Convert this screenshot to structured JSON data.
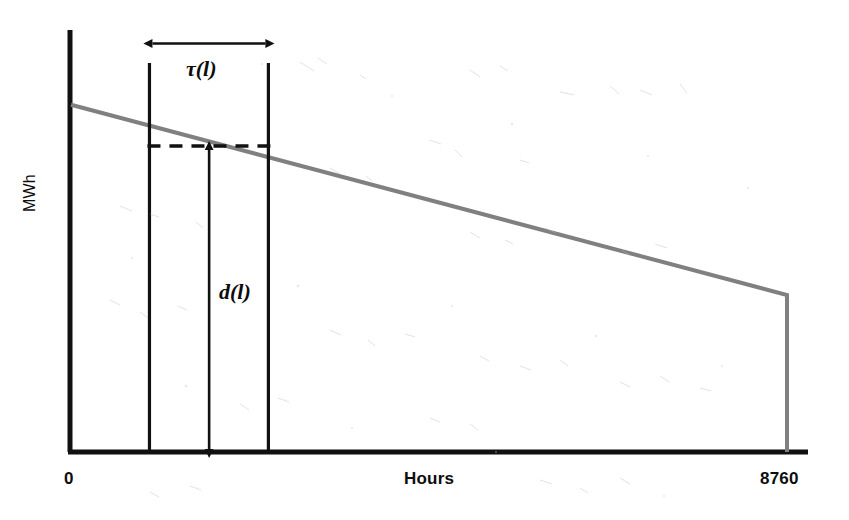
{
  "figure": {
    "kind": "load-duration-curve",
    "background_color": "#ffffff",
    "axis_color": "#111111",
    "curve_color": "#808080",
    "annotation_color": "#0d0d0d"
  },
  "axes": {
    "y_title": "MWh",
    "x_title": "Hours",
    "x_min_label": "0",
    "x_max_label": "8760"
  },
  "annotations": {
    "tau_label": "τ(l)",
    "d_label": "d(l)"
  },
  "chart_data": {
    "type": "line",
    "title": "",
    "subtitle": "",
    "xlabel": "Hours",
    "ylabel": "MWh",
    "xlim": [
      0,
      8760
    ],
    "ylim": [
      0,
      100
    ],
    "grid": false,
    "legend": "none",
    "xticklabels": [
      "0",
      "8760"
    ],
    "yticklabels": [],
    "series": [
      {
        "name": "Load duration curve",
        "color": "#808080",
        "style": "solid",
        "width": 4,
        "x": [
          0,
          8760,
          8760
        ],
        "y": [
          82.3,
          37.2,
          0
        ]
      }
    ],
    "reference_lines": [
      {
        "name": "segment-start",
        "orientation": "vertical",
        "x": 960,
        "y_from": 0,
        "y_to": 92.2,
        "color": "#111111",
        "style": "solid"
      },
      {
        "name": "segment-end",
        "orientation": "vertical",
        "x": 2415,
        "y_from": 0,
        "y_to": 92.2,
        "color": "#111111",
        "style": "solid"
      },
      {
        "name": "demand-level",
        "orientation": "horizontal",
        "y": 72.5,
        "x_from": 960,
        "x_to": 2415,
        "color": "#111111",
        "style": "dashed"
      }
    ],
    "measures": [
      {
        "name": "tau",
        "label": "τ(l)",
        "orientation": "horizontal",
        "from": 960,
        "to": 2415,
        "at": 96.8,
        "arrowheads": "both",
        "meaning": "duration of load block l (hours)"
      },
      {
        "name": "d",
        "label": "d(l)",
        "orientation": "vertical",
        "from": 0,
        "to": 72.5,
        "at": 1690,
        "arrowheads": "both",
        "meaning": "demand level of load block l (MWh)"
      }
    ]
  }
}
